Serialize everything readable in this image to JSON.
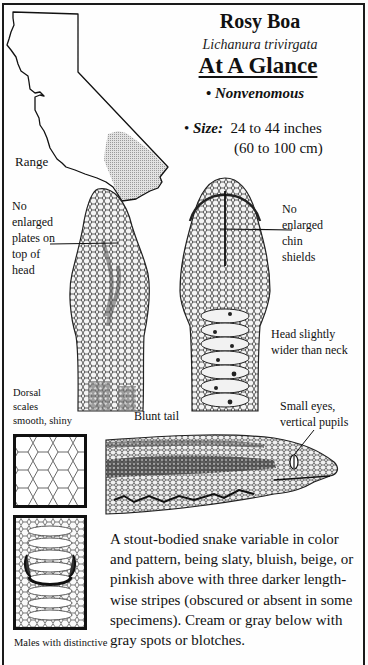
{
  "header": {
    "title": "Rosy Boa",
    "scientific_name": "Lichanura trivirgata",
    "subtitle": "At A Glance"
  },
  "facts": {
    "venom_bullet": "•",
    "venom_status": "Nonvenomous",
    "size_bullet": "•",
    "size_label": "Size:",
    "size_inches": "24 to 44 inches",
    "size_cm": "(60 to 100 cm)"
  },
  "map": {
    "label": "Range",
    "outline_color": "#111111",
    "range_fill_color": "#c8c8c8"
  },
  "annotations": {
    "top_head": [
      "No",
      "enlarged",
      "plates on",
      "top of",
      "head"
    ],
    "chin": [
      "No",
      "enlarged",
      "chin",
      "shields"
    ],
    "head_width": [
      "Head slightly",
      "wider than neck"
    ],
    "dorsal": [
      "Dorsal",
      "scales",
      "smooth, shiny"
    ],
    "tail": "Blunt tail",
    "eyes": [
      "Small eyes,",
      "vertical pupils"
    ],
    "males": "Males with distinctive"
  },
  "description": "A stout-bodied snake variable in color and pattern, being slaty, bluish, beige, or pinkish above with three darker length-wise stripes (obscured or absent in some specimens). Cream or gray below with gray spots or blotches."
}
